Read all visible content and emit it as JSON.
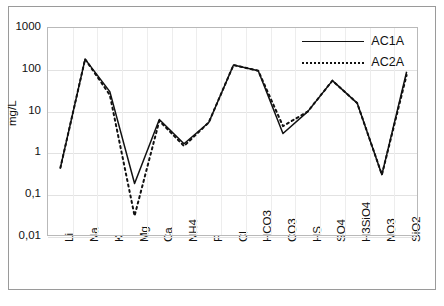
{
  "chart_data": {
    "type": "line",
    "title": "",
    "xlabel": "",
    "ylabel": "mg/L",
    "yscale": "log",
    "ylim": [
      0.01,
      1000
    ],
    "ytick_labels": [
      "1000",
      "100",
      "10",
      "1",
      "0,1",
      "0,01"
    ],
    "ytick_values": [
      1000,
      100,
      10,
      1,
      0.1,
      0.01
    ],
    "grid": true,
    "legend_position": "top-right",
    "categories": [
      "Li",
      "Na",
      "K",
      "Mg",
      "Ca",
      "NH4",
      "F",
      "Cl",
      "HCO3",
      "CO3",
      "HS",
      "SO4",
      "H3SiO4",
      "NO3",
      "SiO2"
    ],
    "series": [
      {
        "name": "AC1A",
        "style": "solid",
        "color": "#111111",
        "values": [
          0.45,
          180,
          30,
          0.19,
          6.5,
          1.7,
          5.5,
          130,
          95,
          3.0,
          10,
          55,
          16,
          0.31,
          90
        ]
      },
      {
        "name": "AC2A",
        "style": "dotted",
        "color": "#111111",
        "values": [
          0.45,
          180,
          25,
          0.032,
          6.0,
          1.5,
          5.5,
          130,
          95,
          4.5,
          10,
          55,
          16,
          0.31,
          75
        ]
      }
    ]
  },
  "legend": {
    "entries": [
      {
        "label": "AC1A",
        "style": "solid"
      },
      {
        "label": "AC2A",
        "style": "dotted"
      }
    ]
  }
}
